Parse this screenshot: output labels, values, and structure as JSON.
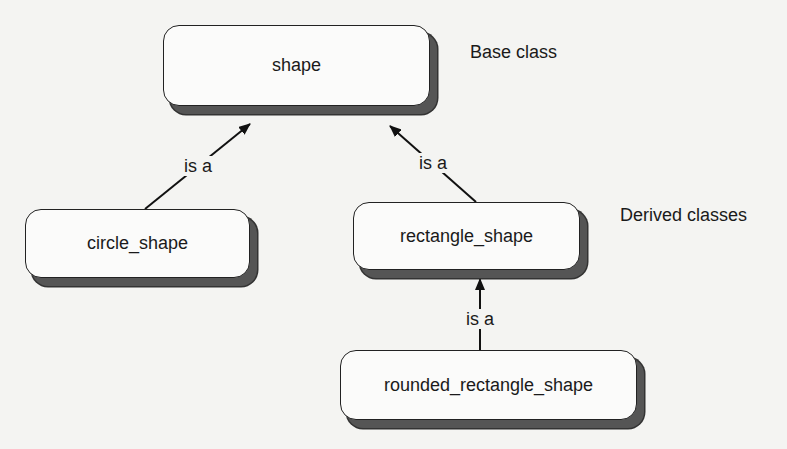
{
  "diagram": {
    "type": "class-inheritance",
    "nodes": [
      {
        "id": "shape",
        "label": "shape",
        "x": 163,
        "y": 25,
        "w": 267,
        "h": 81
      },
      {
        "id": "circle_shape",
        "label": "circle_shape",
        "x": 25,
        "y": 209,
        "w": 225,
        "h": 69
      },
      {
        "id": "rectangle_shape",
        "label": "rectangle_shape",
        "x": 353,
        "y": 202,
        "w": 227,
        "h": 68
      },
      {
        "id": "rounded_rectangle_shape",
        "label": "rounded_rectangle_shape",
        "x": 340,
        "y": 350,
        "w": 297,
        "h": 70
      }
    ],
    "edges": [
      {
        "from": "circle_shape",
        "to": "shape",
        "label": "is a"
      },
      {
        "from": "rectangle_shape",
        "to": "shape",
        "label": "is a"
      },
      {
        "from": "rounded_rectangle_shape",
        "to": "rectangle_shape",
        "label": "is a"
      }
    ],
    "annotations": {
      "base": "Base class",
      "derived": "Derived classes"
    }
  },
  "colors": {
    "background": "#f4f4f2",
    "box_fill": "#fbfbfa",
    "border": "#222222",
    "shadow": "#555555",
    "text": "#1a1a1a"
  }
}
